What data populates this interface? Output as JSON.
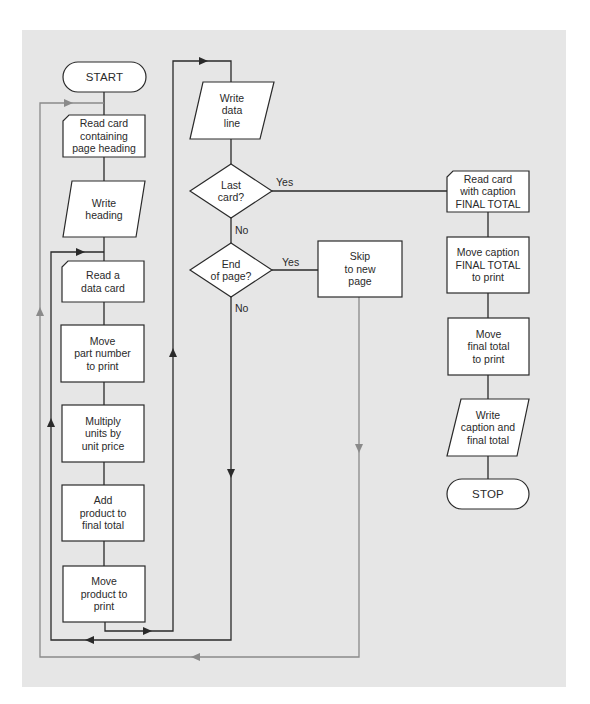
{
  "diagram": {
    "type": "flowchart",
    "colors": {
      "background": "#e6e6e6",
      "shape_fill": "#ffffff",
      "line": "#2a2a2a",
      "gray_line": "#8a8a8a"
    },
    "nodes": {
      "start": {
        "shape": "terminal",
        "label": "START"
      },
      "read_heading": {
        "shape": "card",
        "label": "Read card\ncontaining\npage heading"
      },
      "write_heading": {
        "shape": "io",
        "label": "Write\nheading"
      },
      "read_data": {
        "shape": "card",
        "label": "Read a\ndata card"
      },
      "move_part": {
        "shape": "process",
        "label": "Move\npart number\nto print"
      },
      "multiply": {
        "shape": "process",
        "label": "Multiply\nunits by\nunit price"
      },
      "add_product": {
        "shape": "process",
        "label": "Add\nproduct to\nfinal total"
      },
      "move_product": {
        "shape": "process",
        "label": "Move\nproduct to\nprint"
      },
      "write_data": {
        "shape": "io",
        "label": "Write\ndata\nline"
      },
      "last_card": {
        "shape": "decision",
        "label": "Last\ncard?"
      },
      "end_page": {
        "shape": "decision",
        "label": "End\nof page?"
      },
      "skip_page": {
        "shape": "process",
        "label": "Skip\nto new\npage"
      },
      "read_caption": {
        "shape": "card",
        "label": "Read card\nwith caption\nFINAL TOTAL"
      },
      "move_caption": {
        "shape": "process",
        "label": "Move caption\nFINAL TOTAL\nto print"
      },
      "move_total": {
        "shape": "process",
        "label": "Move\nfinal total\nto print"
      },
      "write_caption": {
        "shape": "io",
        "label": "Write\ncaption and\nfinal total"
      },
      "stop": {
        "shape": "terminal",
        "label": "STOP"
      }
    },
    "edge_labels": {
      "last_card_yes": "Yes",
      "last_card_no": "No",
      "end_page_yes": "Yes",
      "end_page_no": "No"
    }
  }
}
